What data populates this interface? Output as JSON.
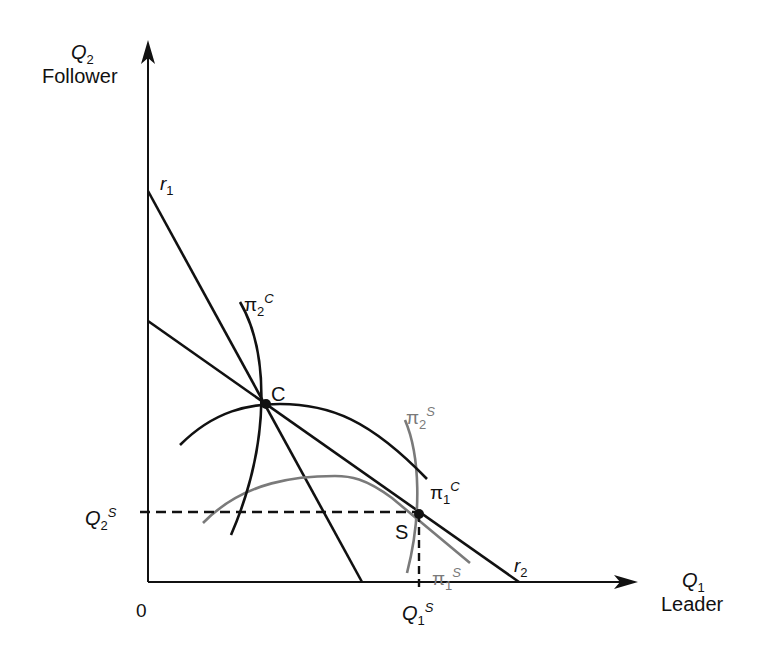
{
  "diagram": {
    "axes": {
      "y": {
        "symbol": "Q",
        "subscript": "2",
        "label": "Follower"
      },
      "x": {
        "symbol": "Q",
        "subscript": "1",
        "label": "Leader"
      },
      "origin": "0"
    },
    "reaction_curves": [
      {
        "id": "r1",
        "symbol": "r",
        "subscript": "1"
      },
      {
        "id": "r2",
        "symbol": "r",
        "subscript": "2"
      }
    ],
    "isoprofit_curves": [
      {
        "id": "pi2C",
        "symbol": "π",
        "subscript": "2",
        "superscript": "C",
        "color": "#111111"
      },
      {
        "id": "pi1C",
        "symbol": "π",
        "subscript": "1",
        "superscript": "C",
        "color": "#111111"
      },
      {
        "id": "pi2S",
        "symbol": "π",
        "subscript": "2",
        "superscript": "S",
        "color": "#7a7a7a"
      },
      {
        "id": "pi1S",
        "symbol": "π",
        "subscript": "1",
        "superscript": "S",
        "color": "#7a7a7a"
      }
    ],
    "points": [
      {
        "id": "C",
        "label": "C"
      },
      {
        "id": "S",
        "label": "S"
      }
    ],
    "equilibrium_labels": {
      "q2s": {
        "symbol": "Q",
        "subscript": "2",
        "superscript": "S"
      },
      "q1s": {
        "symbol": "Q",
        "subscript": "1",
        "superscript": "S"
      }
    },
    "colors": {
      "line": "#111111",
      "stackelberg": "#7a7a7a"
    }
  }
}
